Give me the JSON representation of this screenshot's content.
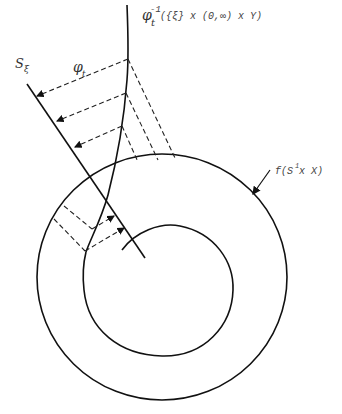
{
  "diagram": {
    "labels": {
      "preimage": {
        "base": "φ",
        "sub": "t",
        "sup": "-1",
        "rest": "({ξ} x (0,∞) x Y)"
      },
      "section": {
        "base": "S",
        "sub": "ξ"
      },
      "flow": {
        "base": "φ",
        "sub": "t"
      },
      "image": {
        "f": "f(S",
        "sup": "1",
        "rest": " x X)"
      }
    },
    "colors": {
      "stroke": "#111111",
      "dash": "#222222",
      "background": "#ffffff"
    },
    "elements": [
      "outer-circle f(S^1 x X)",
      "inner spiral curve",
      "curve φ_t^{-1}({ξ} x (0,∞) x Y)",
      "transversal line S_ξ",
      "dashed flow arrows φ_t",
      "dashed projection lines"
    ]
  }
}
